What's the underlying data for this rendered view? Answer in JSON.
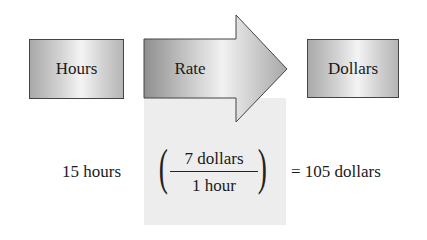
{
  "diagram": {
    "source_box": {
      "label": "Hours"
    },
    "converter_arrow": {
      "label": "Rate"
    },
    "target_box": {
      "label": "Dollars"
    }
  },
  "equation": {
    "given": "15 hours",
    "open_paren": "(",
    "numerator": "7 dollars",
    "denominator": "1 hour",
    "close_paren": ")",
    "result": "= 105 dollars"
  },
  "colors": {
    "panel": "#ededed",
    "box_border": "#444444"
  }
}
